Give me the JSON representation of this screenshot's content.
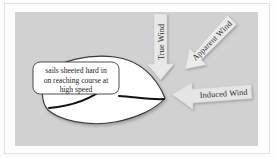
{
  "figure": {
    "kind": "sailing-vector-diagram",
    "background_color": "#d1d1d1",
    "page_color": "#fdfdfd",
    "frame_color": "#e2e2e2"
  },
  "hull": {
    "name": "sailboat-hull",
    "fill_color": "#ffffff",
    "outline_color": "#3a3a3a",
    "bow_direction": "right"
  },
  "sails": {
    "main": {
      "name": "mainsail-curve",
      "color": "#111111"
    },
    "jib": {
      "name": "jib-curve",
      "color": "#111111"
    },
    "mast_dot_color": "#111111"
  },
  "callout": {
    "fill_color": "#ffffff",
    "outline_color": "#3a3a3a",
    "lines": [
      "sails sheeted hard in",
      "on reaching course at",
      "high speed"
    ]
  },
  "arrows": [
    {
      "id": "true-wind",
      "label": "True Wind",
      "direction": "down",
      "angle_deg": 90,
      "fill_color": "#e8e8e8",
      "label_rotation_deg": -90
    },
    {
      "id": "apparent-wind",
      "label": "Apparent Wind",
      "direction": "down-left",
      "angle_deg": 135,
      "fill_color": "#ebebeb",
      "label_rotation_deg": -45
    },
    {
      "id": "induced-wind",
      "label": "Induced Wind",
      "direction": "left",
      "angle_deg": 180,
      "fill_color": "#e5e5e5",
      "label_rotation_deg": -4
    }
  ]
}
